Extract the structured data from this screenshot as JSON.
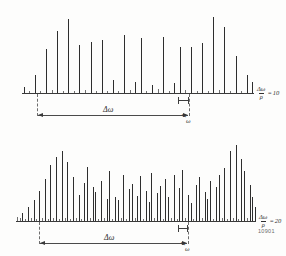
{
  "figure": {
    "plate_number": "10901"
  },
  "labels": {
    "delta_omega": "Δω",
    "rho": "ρ",
    "omega": "ω",
    "equals": "=",
    "ratio_numerator": "Δω",
    "ratio_denominator": "ρ"
  },
  "chart_data": [
    {
      "type": "bar",
      "title": "Δω/ρ = 10",
      "xlabel": "ω",
      "ylabel": "",
      "grid": false,
      "legend": null,
      "index_value": 10,
      "ratio_label": "10",
      "span_label": "Δω",
      "spacing_label": "ρ",
      "axis_label": "ω",
      "ylim": [
        0,
        1
      ],
      "x": [
        1,
        2,
        3,
        4,
        5,
        6,
        7,
        8,
        9,
        10,
        11,
        12,
        13,
        14,
        15,
        16,
        17,
        18,
        19,
        20,
        21,
        22,
        23,
        24,
        25,
        26,
        27,
        28,
        29,
        30,
        31,
        32,
        33,
        34,
        35,
        36,
        37,
        38,
        39,
        40,
        41,
        42
      ],
      "values": [
        0.07,
        0.03,
        0.22,
        0.02,
        0.55,
        0.04,
        0.78,
        0.03,
        0.92,
        0.02,
        0.6,
        0.04,
        0.64,
        0.03,
        0.66,
        0.02,
        0.16,
        0.03,
        0.72,
        0.04,
        0.14,
        0.69,
        0.03,
        0.1,
        0.05,
        0.7,
        0.03,
        0.12,
        0.57,
        0.04,
        0.58,
        0.03,
        0.62,
        0.02,
        0.95,
        0.04,
        0.83,
        0.03,
        0.46,
        0.02,
        0.23,
        0.14
      ]
    },
    {
      "type": "bar",
      "title": "Δω/ρ = 20",
      "xlabel": "ω",
      "ylabel": "",
      "grid": false,
      "legend": null,
      "index_value": 20,
      "ratio_label": "20",
      "span_label": "Δω",
      "spacing_label": "ρ",
      "axis_label": "ω",
      "ylim": [
        0,
        1
      ],
      "x": [
        1,
        2,
        3,
        4,
        5,
        6,
        7,
        8,
        9,
        10,
        11,
        12,
        13,
        14,
        15,
        16,
        17,
        18,
        19,
        20,
        21,
        22,
        23,
        24,
        25,
        26,
        27,
        28,
        29,
        30,
        31,
        32,
        33,
        34,
        35,
        36,
        37,
        38,
        39,
        40,
        41,
        42,
        43,
        44,
        45,
        46,
        47,
        48,
        49,
        50,
        51,
        52,
        53,
        54,
        55,
        56,
        57,
        58,
        59,
        60,
        61,
        62,
        63,
        64,
        65,
        66,
        67,
        68,
        69,
        70,
        71,
        72,
        73,
        74,
        75,
        76,
        77,
        78,
        79,
        80,
        81,
        82,
        83,
        84,
        85,
        86
      ],
      "values": [
        0.05,
        0.04,
        0.1,
        0.03,
        0.17,
        0.04,
        0.26,
        0.03,
        0.37,
        0.04,
        0.52,
        0.03,
        0.7,
        0.04,
        0.8,
        0.03,
        0.88,
        0.04,
        0.74,
        0.03,
        0.55,
        0.04,
        0.33,
        0.03,
        0.48,
        0.68,
        0.04,
        0.42,
        0.36,
        0.03,
        0.5,
        0.04,
        0.28,
        0.62,
        0.03,
        0.3,
        0.26,
        0.04,
        0.58,
        0.03,
        0.4,
        0.46,
        0.04,
        0.31,
        0.56,
        0.03,
        0.38,
        0.24,
        0.6,
        0.04,
        0.35,
        0.44,
        0.03,
        0.52,
        0.3,
        0.04,
        0.57,
        0.03,
        0.41,
        0.64,
        0.04,
        0.33,
        0.22,
        0.03,
        0.45,
        0.55,
        0.04,
        0.36,
        0.27,
        0.5,
        0.03,
        0.42,
        0.58,
        0.04,
        0.66,
        0.03,
        0.87,
        0.04,
        0.95,
        0.03,
        0.78,
        0.62,
        0.04,
        0.45,
        0.3,
        0.18
      ]
    }
  ]
}
